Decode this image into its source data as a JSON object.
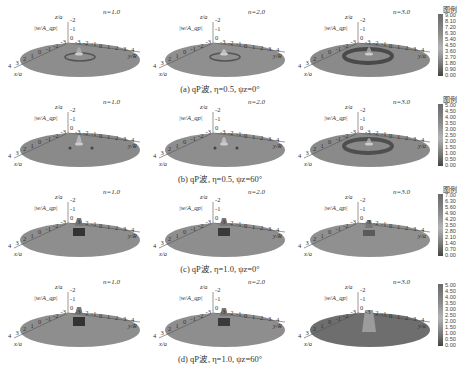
{
  "figure": {
    "rows": [
      {
        "id": "a",
        "caption": "(a) qP波, η=0.5, ψz=0°",
        "legend": {
          "title": "图例",
          "ticks": [
            "9.00",
            "8.10",
            "7.20",
            "6.30",
            "5.40",
            "4.50",
            "3.60",
            "2.70",
            "1.80",
            "0.90",
            "0.00"
          ]
        },
        "panels": [
          {
            "n_label": "n=1.0",
            "y_axis_label": "y/R"
          },
          {
            "n_label": "n=2.0",
            "y_axis_label": "y/R"
          },
          {
            "n_label": "n=3.0",
            "y_axis_label": "y/a"
          }
        ]
      },
      {
        "id": "b",
        "caption": "(b) qP波, η=0.5, ψz=60°",
        "legend": {
          "title": "图例",
          "ticks": [
            "5.00",
            "4.50",
            "4.00",
            "3.50",
            "3.00",
            "2.50",
            "2.00",
            "1.50",
            "1.00",
            "0.50",
            "0.00"
          ]
        },
        "panels": [
          {
            "n_label": "n=1.0",
            "y_axis_label": "y/R"
          },
          {
            "n_label": "n=2.0",
            "y_axis_label": "y/R"
          },
          {
            "n_label": "n=3.0",
            "y_axis_label": "y/a"
          }
        ]
      },
      {
        "id": "c",
        "caption": "(c) qP波, η=1.0, ψz=0°",
        "legend": {
          "title": "图例",
          "ticks": [
            "7.00",
            "6.30",
            "5.60",
            "4.90",
            "4.20",
            "3.50",
            "2.80",
            "2.10",
            "1.40",
            "0.70",
            "0.00"
          ]
        },
        "panels": [
          {
            "n_label": "n=1.0",
            "y_axis_label": "y/R"
          },
          {
            "n_label": "n=2.0",
            "y_axis_label": "y/R"
          },
          {
            "n_label": "n=3.0",
            "y_axis_label": "y/a"
          }
        ]
      },
      {
        "id": "d",
        "caption": "(d) qP波, η=1.0, ψz=60°",
        "legend": {
          "title": "",
          "ticks": [
            "5.00",
            "4.50",
            "4.00",
            "3.50",
            "3.00",
            "2.50",
            "2.00",
            "1.50",
            "1.00",
            "0.50",
            "0.00"
          ]
        },
        "panels": [
          {
            "n_label": "n=1.0",
            "y_axis_label": "y/R"
          },
          {
            "n_label": "n=2.0",
            "y_axis_label": "y/R"
          },
          {
            "n_label": "n=3.0",
            "y_axis_label": "y/a"
          }
        ]
      }
    ],
    "axes": {
      "z_label": "z/a",
      "w_label": "|w/A_qp|",
      "z_ticks": [
        "-2",
        "-1",
        "0"
      ],
      "x_label": "x/a",
      "x_ticks": [
        "4",
        "3",
        "2",
        "1",
        "0",
        "-1",
        "-2",
        "-3"
      ],
      "y_ticks": [
        "-3",
        "-2",
        "-1",
        "0",
        "1",
        "2",
        "3",
        "4"
      ]
    }
  }
}
